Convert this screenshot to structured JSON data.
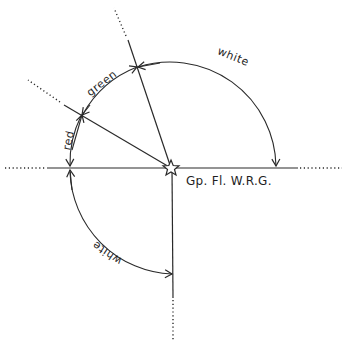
{
  "diagram": {
    "light_characteristic": "Gp. Fl. W.R.G.",
    "light_symbol": "star-icon",
    "sectors": [
      {
        "name": "white",
        "label": "white",
        "from_bearing_deg": 340,
        "to_bearing_deg": 90
      },
      {
        "name": "green",
        "label": "green",
        "from_bearing_deg": 300,
        "to_bearing_deg": 340
      },
      {
        "name": "red",
        "label": "red",
        "from_bearing_deg": 270,
        "to_bearing_deg": 300
      },
      {
        "name": "white-lower",
        "label": "white",
        "from_bearing_deg": 180,
        "to_bearing_deg": 270
      }
    ]
  }
}
